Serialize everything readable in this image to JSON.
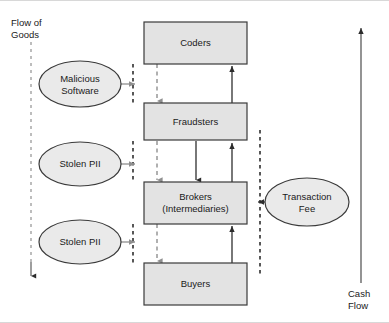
{
  "diagram": {
    "type": "flow-diagram",
    "background_color": "#ffffff",
    "axis_labels": [
      {
        "id": "flow-of-goods",
        "text": "Flow of\nGoods",
        "direction": "downward",
        "line_style": "dashed",
        "color": "#9a9a9a"
      },
      {
        "id": "cash-flow",
        "text": "Cash\nFlow",
        "direction": "upward",
        "line_style": "solid",
        "color": "#555555"
      }
    ],
    "process_boxes": [
      {
        "id": "coders",
        "label": "Coders",
        "x": 144,
        "y": 22,
        "w": 103,
        "h": 42,
        "fill": "#e3e3e3",
        "stroke": "#3a3a3a"
      },
      {
        "id": "fraudsters",
        "label": "Fraudsters",
        "x": 144,
        "y": 103,
        "w": 103,
        "h": 37,
        "fill": "#e3e3e3",
        "stroke": "#3a3a3a"
      },
      {
        "id": "brokers",
        "label": "Brokers\n(Intermediaries)",
        "x": 144,
        "y": 182,
        "w": 103,
        "h": 42,
        "fill": "#e3e3e3",
        "stroke": "#3a3a3a"
      },
      {
        "id": "buyers",
        "label": "Buyers",
        "x": 144,
        "y": 263,
        "w": 103,
        "h": 42,
        "fill": "#e3e3e3",
        "stroke": "#3a3a3a"
      }
    ],
    "ellipses": [
      {
        "id": "malicious-software",
        "label": "Malicious\nSoftware",
        "cx": 80,
        "cy": 84,
        "rx": 41,
        "ry": 23,
        "fill": "#eaeaea",
        "stroke": "#3a3a3a"
      },
      {
        "id": "stolen-pii-1",
        "label": "Stolen PII",
        "cx": 80,
        "cy": 164,
        "rx": 41,
        "ry": 22,
        "fill": "#eaeaea",
        "stroke": "#3a3a3a"
      },
      {
        "id": "stolen-pii-2",
        "label": "Stolen PII",
        "cx": 80,
        "cy": 242,
        "rx": 41,
        "ry": 22,
        "fill": "#eaeaea",
        "stroke": "#3a3a3a"
      },
      {
        "id": "transaction-fee",
        "label": "Transaction\nFee",
        "cx": 307,
        "cy": 202,
        "rx": 42,
        "ry": 24,
        "fill": "#eaeaea",
        "stroke": "#3a3a3a"
      }
    ],
    "connectors": {
      "goods_channel_x": 133,
      "goods_inner_x": 157,
      "cash_channel_x": 260,
      "flow_of_goods_axis_x": 31,
      "cash_flow_axis_x": 361,
      "goods_arrows": [
        {
          "from": "malicious-software",
          "to": "goods-channel",
          "y": 84
        },
        {
          "from": "stolen-pii-1",
          "to": "goods-channel",
          "y": 164
        },
        {
          "from": "stolen-pii-2",
          "to": "goods-channel",
          "y": 242
        }
      ],
      "goods_downstream": [
        {
          "from": "coders",
          "to": "fraudsters"
        },
        {
          "from": "fraudsters",
          "to": "brokers"
        },
        {
          "from": "brokers",
          "to": "buyers"
        }
      ],
      "cash_upstream": [
        {
          "from": "fraudsters",
          "to": "coders"
        },
        {
          "from": "brokers",
          "to": "fraudsters"
        },
        {
          "from": "buyers",
          "to": "brokers"
        }
      ],
      "fee_arrow": {
        "from": "transaction-fee",
        "to": "cash-channel",
        "y": 202
      }
    }
  }
}
